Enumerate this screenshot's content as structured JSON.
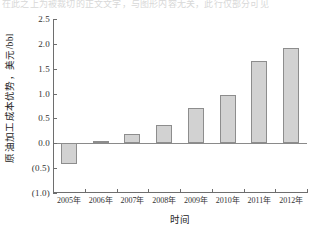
{
  "page": {
    "cropped_header_text": "在此之上为被裁切的正文文字，与图形内容无关，此行仅部分可见"
  },
  "chart_data": {
    "type": "bar",
    "title": "",
    "categories": [
      "2005年",
      "2006年",
      "2007年",
      "2008年",
      "2009年",
      "2010年",
      "2011年",
      "2012年"
    ],
    "values": [
      -0.42,
      0.05,
      0.19,
      0.37,
      0.7,
      0.98,
      1.65,
      1.91
    ],
    "series": [
      {
        "name": "原油加工成本优势",
        "values": [
          -0.42,
          0.05,
          0.19,
          0.37,
          0.7,
          0.98,
          1.65,
          1.91
        ]
      }
    ],
    "xlabel": "时间",
    "ylabel": "原油加工成本优势，美元/bbl",
    "ylim": [
      -1.0,
      2.5
    ],
    "ytick_values": [
      2.5,
      2.0,
      1.5,
      1.0,
      0.5,
      0.0,
      -0.5,
      -1.0
    ],
    "ytick_labels": [
      "2.5",
      "2.0",
      "1.5",
      "1.0",
      "0.5",
      "0.0",
      "(0.5)",
      "(1.0)"
    ],
    "grid": false,
    "legend": null,
    "legend_position": "none",
    "bar_fill_color": "#d2d2d2",
    "bar_edge_color": "#8d8d8d",
    "axis_color": "#6e6e6e",
    "zero_line_value": 0.0
  }
}
